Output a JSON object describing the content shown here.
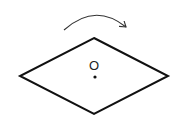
{
  "diagram": {
    "type": "rotation-diagram",
    "shape": "rhombus",
    "center_label": "O",
    "rotation_direction": "clockwise",
    "colors": {
      "stroke": "#111111",
      "background": "#ffffff",
      "arrow": "#333333"
    }
  }
}
